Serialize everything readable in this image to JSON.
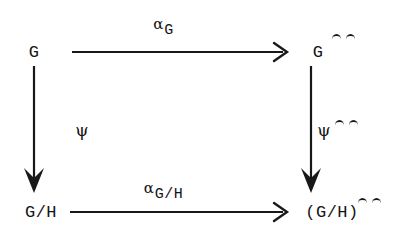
{
  "diagram": {
    "background_color": "#ffffff",
    "ink_color": "#141414",
    "nodes": [
      {
        "id": "top-left",
        "base": "G",
        "hats": 0,
        "x": 34,
        "y": 52
      },
      {
        "id": "top-right",
        "base": "G",
        "hats": 2,
        "x": 318,
        "y": 52
      },
      {
        "id": "bottom-left",
        "base": "G/H",
        "hats": 0,
        "x": 41,
        "y": 212
      },
      {
        "id": "bottom-right",
        "base": "(G/H)",
        "hats": 2,
        "x": 332,
        "y": 212
      }
    ],
    "edges": [
      {
        "id": "top-horizontal",
        "from": "top-left",
        "to": "top-right",
        "direction": "right",
        "arrowhead": "open-chevron",
        "label_symbol": "α",
        "label_subscript": "G",
        "label_x": 163,
        "label_y": 24,
        "x1": 72,
        "y1": 52,
        "x2": 284,
        "y2": 52
      },
      {
        "id": "bottom-horizontal",
        "from": "bottom-left",
        "to": "bottom-right",
        "direction": "right",
        "arrowhead": "open-chevron",
        "label_symbol": "α",
        "label_subscript": "G/H",
        "label_x": 163,
        "label_y": 188,
        "x1": 70,
        "y1": 212,
        "x2": 284,
        "y2": 212
      },
      {
        "id": "left-vertical",
        "from": "top-left",
        "to": "bottom-left",
        "direction": "down",
        "arrowhead": "solid-triangle",
        "label_symbol": "ψ",
        "label_hats": 0,
        "label_x": 82,
        "label_y": 130,
        "x1": 34,
        "y1": 66,
        "x2": 34,
        "y2": 193
      },
      {
        "id": "right-vertical",
        "from": "top-right",
        "to": "bottom-right",
        "direction": "down",
        "arrowhead": "solid-triangle",
        "label_symbol": "ψ",
        "label_hats": 2,
        "label_x": 324,
        "label_y": 130,
        "x1": 311,
        "y1": 66,
        "x2": 311,
        "y2": 193
      }
    ]
  },
  "labels": {
    "node_tl": "G",
    "node_tr": "G",
    "node_bl": "G/H",
    "node_br": "(G/H)",
    "alpha": "α",
    "alpha_top_sub": "G",
    "alpha_bottom_sub": "G/H",
    "psi": "ψ"
  }
}
